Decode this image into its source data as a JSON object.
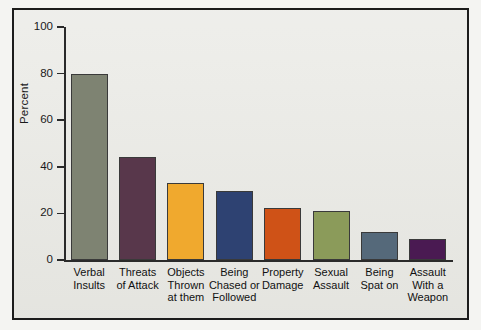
{
  "chart_data": {
    "type": "bar",
    "title": "",
    "xlabel": "",
    "ylabel": "Percent",
    "ylim": [
      0,
      100
    ],
    "yticks": [
      0,
      20,
      40,
      60,
      80,
      100
    ],
    "grid": false,
    "legend": "none",
    "categories": [
      "Verbal Insults",
      "Threats of Attack",
      "Objects Thrown at them",
      "Being Chased or Followed",
      "Property Damage",
      "Sexual Assault",
      "Being Spat on",
      "Assault With a Weapon"
    ],
    "category_lines": [
      [
        "Verbal",
        "Insults"
      ],
      [
        "Threats",
        "of Attack"
      ],
      [
        "Objects",
        "Thrown",
        "at them"
      ],
      [
        "Being",
        "Chased or",
        "Followed"
      ],
      [
        "Property",
        "Damage"
      ],
      [
        "Sexual",
        "Assault"
      ],
      [
        "Being",
        "Spat on"
      ],
      [
        "Assault",
        "With a",
        "Weapon"
      ]
    ],
    "values": [
      80,
      44,
      33,
      29.5,
      22.5,
      21,
      12,
      9
    ],
    "colors": [
      "#7e8372",
      "#58374b",
      "#f0a92e",
      "#2e4272",
      "#cf5217",
      "#8b9b5a",
      "#55697a",
      "#4a1a52"
    ]
  },
  "axis": {
    "tick_labels": [
      "100",
      "80",
      "60",
      "40",
      "20",
      "0"
    ],
    "y_axis_title": "Percent"
  },
  "figure": {
    "background_color": "#e9e9e4",
    "frame_color": "#1c1c1c",
    "page_background": "#ffffff"
  }
}
